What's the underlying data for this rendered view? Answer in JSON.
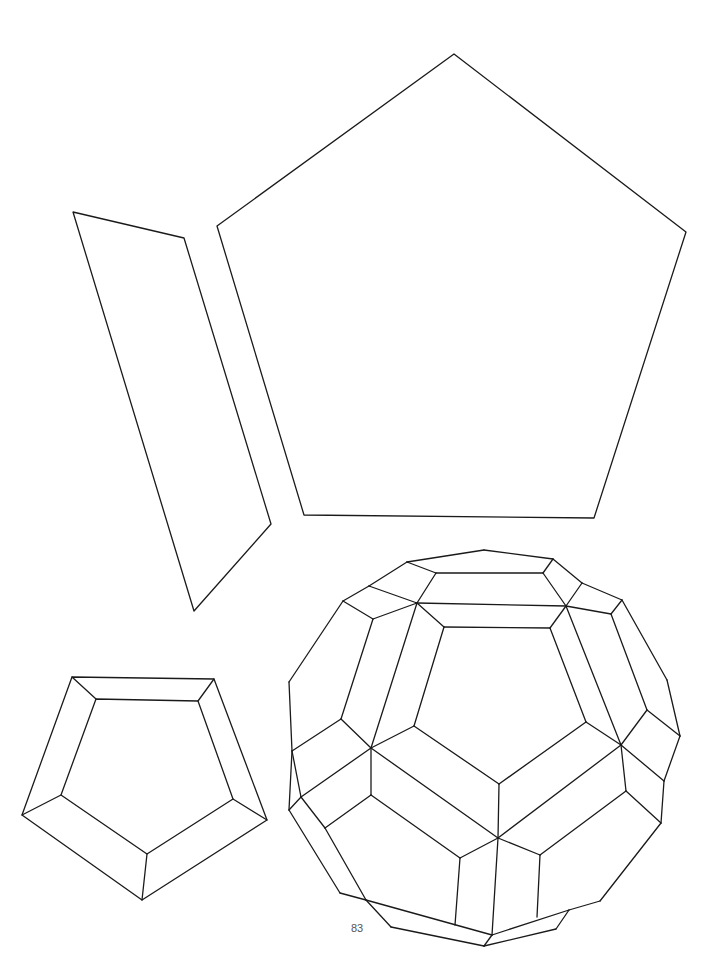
{
  "page": {
    "number": "83",
    "background": "#ffffff",
    "stroke_color": "#1a1a1a"
  },
  "figures": {
    "parallelogram": {
      "label": "parallelogram-net-piece",
      "points": [
        [
          73,
          212
        ],
        [
          184,
          238
        ],
        [
          271,
          524
        ],
        [
          194,
          611
        ]
      ]
    },
    "large_pentagon": {
      "label": "large-pentagon-net-piece",
      "points": [
        [
          454,
          54
        ],
        [
          686,
          232
        ],
        [
          594,
          518
        ],
        [
          304,
          515
        ],
        [
          217,
          226
        ]
      ]
    },
    "framed_pentagon": {
      "label": "framed-pentagon-piece",
      "outer": [
        [
          72,
          677
        ],
        [
          214,
          679
        ],
        [
          267,
          820
        ],
        [
          142,
          900
        ],
        [
          22,
          815
        ]
      ],
      "inner": [
        [
          96,
          699
        ],
        [
          198,
          701
        ],
        [
          233,
          799
        ],
        [
          147,
          854
        ],
        [
          61,
          795
        ]
      ]
    },
    "polyhedron": {
      "label": "rhombicosidodecahedron-like-solid",
      "edges": [
        [
          [
            407,
            562
          ],
          [
            484,
            550
          ]
        ],
        [
          [
            484,
            550
          ],
          [
            553,
            559
          ]
        ],
        [
          [
            407,
            562
          ],
          [
            436,
            573
          ]
        ],
        [
          [
            436,
            573
          ],
          [
            543,
            573
          ]
        ],
        [
          [
            543,
            573
          ],
          [
            553,
            559
          ]
        ],
        [
          [
            407,
            562
          ],
          [
            369,
            586
          ]
        ],
        [
          [
            553,
            559
          ],
          [
            582,
            583
          ]
        ],
        [
          [
            436,
            573
          ],
          [
            417,
            603
          ]
        ],
        [
          [
            543,
            573
          ],
          [
            566,
            606
          ]
        ],
        [
          [
            369,
            586
          ],
          [
            417,
            603
          ]
        ],
        [
          [
            417,
            603
          ],
          [
            566,
            606
          ]
        ],
        [
          [
            566,
            606
          ],
          [
            582,
            583
          ]
        ],
        [
          [
            369,
            586
          ],
          [
            343,
            601
          ]
        ],
        [
          [
            582,
            583
          ],
          [
            622,
            600
          ]
        ],
        [
          [
            343,
            601
          ],
          [
            373,
            619
          ]
        ],
        [
          [
            373,
            619
          ],
          [
            417,
            603
          ]
        ],
        [
          [
            566,
            606
          ],
          [
            611,
            614
          ]
        ],
        [
          [
            611,
            614
          ],
          [
            622,
            600
          ]
        ],
        [
          [
            417,
            603
          ],
          [
            444,
            627
          ]
        ],
        [
          [
            444,
            627
          ],
          [
            550,
            628
          ]
        ],
        [
          [
            550,
            628
          ],
          [
            566,
            606
          ]
        ],
        [
          [
            343,
            601
          ],
          [
            289,
            682
          ]
        ],
        [
          [
            289,
            682
          ],
          [
            292,
            751
          ]
        ],
        [
          [
            373,
            619
          ],
          [
            341,
            719
          ]
        ],
        [
          [
            341,
            719
          ],
          [
            292,
            751
          ]
        ],
        [
          [
            417,
            603
          ],
          [
            371,
            748
          ]
        ],
        [
          [
            444,
            627
          ],
          [
            414,
            726
          ]
        ],
        [
          [
            566,
            606
          ],
          [
            621,
            745
          ]
        ],
        [
          [
            550,
            628
          ],
          [
            586,
            722
          ]
        ],
        [
          [
            611,
            614
          ],
          [
            647,
            710
          ]
        ],
        [
          [
            622,
            600
          ],
          [
            667,
            680
          ]
        ],
        [
          [
            667,
            680
          ],
          [
            680,
            736
          ]
        ],
        [
          [
            647,
            710
          ],
          [
            680,
            736
          ]
        ],
        [
          [
            647,
            710
          ],
          [
            621,
            745
          ]
        ],
        [
          [
            341,
            719
          ],
          [
            371,
            748
          ]
        ],
        [
          [
            414,
            726
          ],
          [
            371,
            748
          ]
        ],
        [
          [
            414,
            726
          ],
          [
            499,
            784
          ]
        ],
        [
          [
            499,
            784
          ],
          [
            586,
            722
          ]
        ],
        [
          [
            586,
            722
          ],
          [
            621,
            745
          ]
        ],
        [
          [
            680,
            736
          ],
          [
            664,
            781
          ]
        ],
        [
          [
            621,
            745
          ],
          [
            664,
            781
          ]
        ],
        [
          [
            621,
            745
          ],
          [
            626,
            791
          ]
        ],
        [
          [
            664,
            781
          ],
          [
            661,
            823
          ]
        ],
        [
          [
            626,
            791
          ],
          [
            661,
            823
          ]
        ],
        [
          [
            499,
            784
          ],
          [
            498,
            838
          ]
        ],
        [
          [
            371,
            748
          ],
          [
            498,
            838
          ]
        ],
        [
          [
            621,
            745
          ],
          [
            498,
            838
          ]
        ],
        [
          [
            371,
            748
          ],
          [
            301,
            797
          ]
        ],
        [
          [
            371,
            748
          ],
          [
            371,
            795
          ]
        ],
        [
          [
            292,
            751
          ],
          [
            301,
            797
          ]
        ],
        [
          [
            292,
            751
          ],
          [
            289,
            810
          ]
        ],
        [
          [
            289,
            810
          ],
          [
            301,
            797
          ]
        ],
        [
          [
            301,
            797
          ],
          [
            325,
            828
          ]
        ],
        [
          [
            371,
            795
          ],
          [
            325,
            828
          ]
        ],
        [
          [
            371,
            795
          ],
          [
            460,
            858
          ]
        ],
        [
          [
            460,
            858
          ],
          [
            498,
            838
          ]
        ],
        [
          [
            626,
            791
          ],
          [
            540,
            855
          ]
        ],
        [
          [
            540,
            855
          ],
          [
            498,
            838
          ]
        ],
        [
          [
            460,
            858
          ],
          [
            455,
            925
          ]
        ],
        [
          [
            498,
            838
          ],
          [
            492,
            935
          ]
        ],
        [
          [
            540,
            855
          ],
          [
            537,
            917
          ]
        ],
        [
          [
            289,
            810
          ],
          [
            340,
            893
          ]
        ],
        [
          [
            340,
            893
          ],
          [
            366,
            900
          ]
        ],
        [
          [
            325,
            828
          ],
          [
            366,
            900
          ]
        ],
        [
          [
            366,
            900
          ],
          [
            391,
            927
          ]
        ],
        [
          [
            366,
            900
          ],
          [
            492,
            935
          ]
        ],
        [
          [
            492,
            935
          ],
          [
            569,
            910
          ]
        ],
        [
          [
            569,
            910
          ],
          [
            600,
            901
          ]
        ],
        [
          [
            661,
            823
          ],
          [
            600,
            901
          ]
        ],
        [
          [
            391,
            927
          ],
          [
            484,
            946
          ]
        ],
        [
          [
            484,
            946
          ],
          [
            556,
            929
          ]
        ],
        [
          [
            556,
            929
          ],
          [
            569,
            910
          ]
        ],
        [
          [
            484,
            946
          ],
          [
            492,
            935
          ]
        ]
      ]
    }
  }
}
